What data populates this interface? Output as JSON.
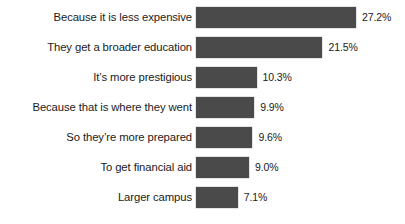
{
  "chart_data": {
    "type": "bar",
    "orientation": "horizontal",
    "title": "",
    "subtitle": "",
    "xlabel": "",
    "ylabel": "",
    "grid": false,
    "legend": null,
    "axis_line": false,
    "xlim": [
      0,
      27.2
    ],
    "value_suffix": "%",
    "bar_color": "#4a4a4a",
    "background_color": "#ffffff",
    "text_color": "#1a1a1a",
    "categories": [
      "Because it is less expensive",
      "They get a broader education",
      "It’s more prestigious",
      "Because that is where they went",
      "So they’re more prepared",
      "To get financial aid",
      "Larger campus"
    ],
    "values": [
      27.2,
      21.5,
      10.3,
      9.9,
      9.6,
      9.0,
      7.1
    ],
    "value_labels": [
      "27.2%",
      "21.5%",
      "10.3%",
      "9.9%",
      "9.6%",
      "9.0%",
      "7.1%"
    ]
  }
}
